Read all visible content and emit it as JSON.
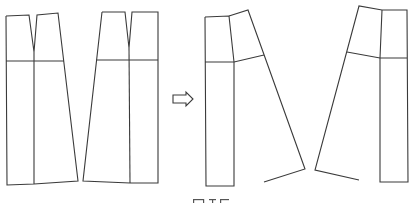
{
  "diagram": {
    "stroke_color": "#3a3a3a",
    "background": "#ffffff",
    "before": {
      "pieces": [
        {
          "name": "front-panel-before",
          "outline": [
            [
              6,
              16
            ],
            [
              29,
              15
            ],
            [
              34,
              52
            ],
            [
              37,
              15
            ],
            [
              58,
              13
            ],
            [
              78,
              181
            ],
            [
              34,
              184
            ],
            [
              7,
              185
            ],
            [
              6,
              16
            ]
          ],
          "hip_line": [
            [
              6,
              61
            ],
            [
              64,
              61
            ]
          ],
          "center_line": [
            [
              34,
              52
            ],
            [
              34,
              184
            ]
          ]
        },
        {
          "name": "back-panel-before",
          "outline": [
            [
              102,
              12
            ],
            [
              125,
              12
            ],
            [
              129,
              48
            ],
            [
              132,
              12
            ],
            [
              158,
              12
            ],
            [
              158,
              183
            ],
            [
              130,
              183
            ],
            [
              83,
              181
            ],
            [
              102,
              12
            ]
          ],
          "hip_line": [
            [
              96,
              60
            ],
            [
              158,
              60
            ]
          ],
          "center_line": [
            [
              129,
              48
            ],
            [
              130,
              183
            ]
          ]
        }
      ]
    },
    "transform_arrow": {
      "direction": "right",
      "x": 173,
      "y": 99,
      "width": 20,
      "height": 12
    },
    "after": {
      "pieces": [
        {
          "name": "front-panel-after",
          "rect": [
            [
              205,
              17
            ],
            [
              229,
              16
            ],
            [
              234,
              62
            ],
            [
              234,
              186
            ],
            [
              206,
              186
            ],
            [
              205,
              17
            ]
          ],
          "flare": [
            [
              229,
              16
            ],
            [
              248,
              10
            ],
            [
              305,
              169
            ],
            [
              264,
              182
            ]
          ],
          "hip_line": [
            [
              205,
              62
            ],
            [
              234,
              62
            ],
            [
              264,
              55
            ]
          ]
        },
        {
          "name": "back-panel-after",
          "rect": [
            [
              382,
              10
            ],
            [
              407,
              10
            ],
            [
              408,
              182
            ],
            [
              380,
              182
            ],
            [
              380,
              58
            ],
            [
              382,
              10
            ]
          ],
          "flare": [
            [
              382,
              10
            ],
            [
              359,
              6
            ],
            [
              315,
              170
            ],
            [
              359,
              180
            ]
          ],
          "hip_line": [
            [
              347,
              52
            ],
            [
              380,
              58
            ],
            [
              407,
              58
            ]
          ]
        }
      ]
    },
    "caption": {
      "visible": "partially cut off at bottom edge",
      "text": ""
    }
  }
}
